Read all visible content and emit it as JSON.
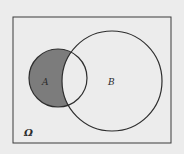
{
  "diagram": {
    "type": "venn",
    "universe": {
      "label": "Ω",
      "x": 13,
      "y": 17,
      "width": 158,
      "height": 126
    },
    "sets": [
      {
        "name": "A",
        "label": "A",
        "cx": 58,
        "cy": 78,
        "r": 29,
        "label_x": 42,
        "label_y": 85
      },
      {
        "name": "B",
        "label": "B",
        "cx": 112,
        "cy": 81,
        "r": 50,
        "label_x": 108,
        "label_y": 85
      }
    ],
    "shaded_region": "A minus B",
    "colors": {
      "background": "#ececec",
      "stroke": "#2e2e2e",
      "shade": "#7c7c7c"
    },
    "omega_label_pos": {
      "x": 24,
      "y": 136
    }
  }
}
